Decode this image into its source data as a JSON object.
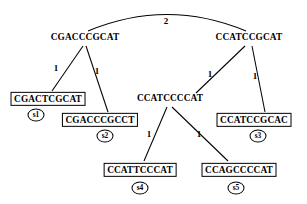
{
  "diagram": {
    "background_color": "#ffffff",
    "line_color": "#000000",
    "text_color": "#000000"
  },
  "nodes": [
    {
      "id": "n1",
      "label": "CGACCCGCAT",
      "kind": "internal",
      "x": 85,
      "y": 38
    },
    {
      "id": "n2",
      "label": "CCATCCGCAT",
      "kind": "internal",
      "x": 249,
      "y": 38
    },
    {
      "id": "n3",
      "label": "CCATCCCCAT",
      "kind": "internal",
      "x": 170,
      "y": 99
    },
    {
      "id": "l1",
      "label": "CGACTCGCAT",
      "kind": "leaf",
      "taxon": "s1",
      "x": 48,
      "y": 99,
      "taxon_x": 36,
      "taxon_y": 115
    },
    {
      "id": "l2",
      "label": "CGACCCGCCT",
      "kind": "leaf",
      "taxon": "s2",
      "x": 100,
      "y": 120,
      "taxon_x": 105,
      "taxon_y": 136
    },
    {
      "id": "l3",
      "label": "CCATCCGCAC",
      "kind": "leaf",
      "taxon": "s3",
      "x": 254,
      "y": 120,
      "taxon_x": 258,
      "taxon_y": 136
    },
    {
      "id": "l4",
      "label": "CCATTCCCAT",
      "kind": "leaf",
      "taxon": "s4",
      "x": 140,
      "y": 170,
      "taxon_x": 140,
      "taxon_y": 188
    },
    {
      "id": "l5",
      "label": "CCAGCCCCAT",
      "kind": "leaf",
      "taxon": "s5",
      "x": 239,
      "y": 170,
      "taxon_x": 236,
      "taxon_y": 188
    }
  ],
  "edges": [
    {
      "from": "n1",
      "to": "n2",
      "weight": "2",
      "shape": "arc",
      "label_x": 166,
      "label_y": 21
    },
    {
      "from": "n1",
      "to": "l1",
      "weight": "1",
      "shape": "straight",
      "label_x": 56,
      "label_y": 68
    },
    {
      "from": "n1",
      "to": "l2",
      "weight": "1",
      "shape": "straight",
      "label_x": 97,
      "label_y": 71
    },
    {
      "from": "n2",
      "to": "n3",
      "weight": "1",
      "shape": "straight",
      "label_x": 210,
      "label_y": 74
    },
    {
      "from": "n2",
      "to": "l3",
      "weight": "1",
      "shape": "straight",
      "label_x": 255,
      "label_y": 76
    },
    {
      "from": "n3",
      "to": "l4",
      "weight": "1",
      "shape": "straight",
      "label_x": 149,
      "label_y": 134
    },
    {
      "from": "n3",
      "to": "l5",
      "weight": "1",
      "shape": "straight",
      "label_x": 199,
      "label_y": 134
    }
  ],
  "edge_geometry": {
    "arc_n1_n2": "M 88 31 Q 167 -2 246 31",
    "line_n1_l1": "M 83 46 L 52 91",
    "line_n1_l2": "M 86 46 L 108 112",
    "line_n2_n3": "M 245 46 L 196 93",
    "line_n2_l3": "M 252 46 L 265 112",
    "line_n3_l4": "M 167 107 L 144 161",
    "line_n3_l5": "M 172 107 L 228 161"
  }
}
